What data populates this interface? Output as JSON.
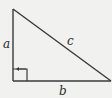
{
  "diagram": {
    "type": "right-triangle",
    "colors": {
      "background": "#f1f1ef",
      "stroke": "#3a3a3a",
      "text": "#2b2b2b"
    },
    "vertices": {
      "top": [
        13,
        9
      ],
      "right_angle": [
        13,
        81
      ],
      "right": [
        111,
        81
      ]
    },
    "labels": {
      "a": "a",
      "b": "b",
      "c": "c"
    },
    "right_angle_marker": true
  }
}
